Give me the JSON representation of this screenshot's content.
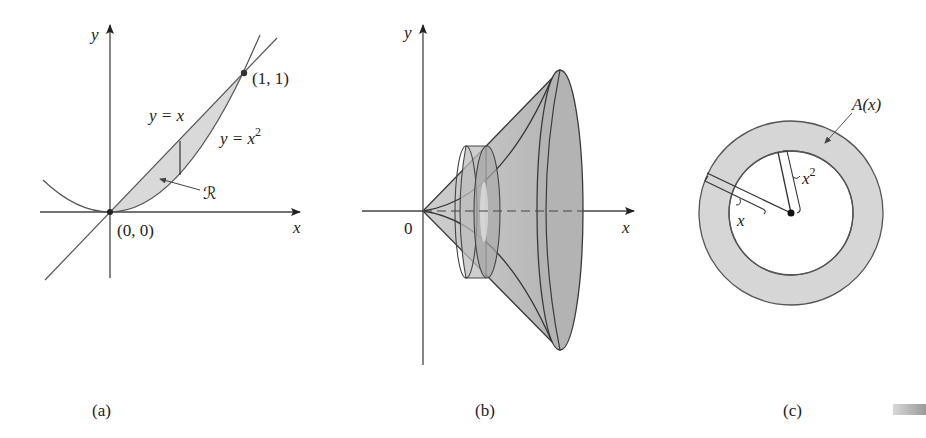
{
  "figure": {
    "panels": [
      {
        "id": "a",
        "caption": "(a)",
        "axis_x_label": "x",
        "axis_y_label": "y",
        "curve_line_label": "y = x",
        "curve_parabola_label_base": "y = x",
        "curve_parabola_label_exp": "2",
        "region_label": "ℛ",
        "point_origin_label": "(0, 0)",
        "point_intersection_label": "(1, 1)"
      },
      {
        "id": "b",
        "caption": "(b)",
        "axis_x_label": "x",
        "axis_y_label": "y",
        "origin_label": "0"
      },
      {
        "id": "c",
        "caption": "(c)",
        "area_label": "A(x)",
        "outer_radius_label": "x",
        "inner_radius_label_base": "x",
        "inner_radius_label_exp": "2"
      }
    ],
    "colors": {
      "line": "#444444",
      "fill_light": "#d9d9d9",
      "fill_solid": "#b8b8b8",
      "fill_dark": "#a9a9a9",
      "text": "#222222"
    }
  }
}
